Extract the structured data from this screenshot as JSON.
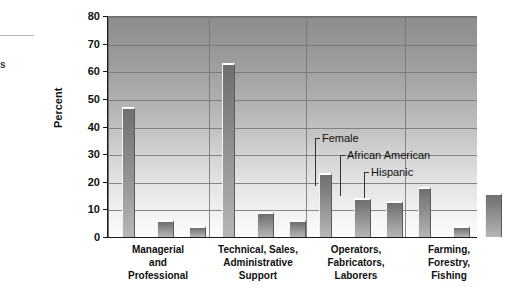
{
  "page": {
    "left_margin_fragment": "s"
  },
  "chart_data": {
    "type": "bar",
    "title": "",
    "subtitle": "",
    "xlabel": "",
    "ylabel": "Percent",
    "ylim": [
      0,
      80
    ],
    "yticks": [
      0,
      10,
      20,
      30,
      40,
      50,
      60,
      70,
      80
    ],
    "ytick_labels": [
      "0",
      "10",
      "20",
      "30",
      "40",
      "50",
      "60",
      "70",
      "80"
    ],
    "grid": true,
    "legend_position": "inline-annotations",
    "categories": [
      "Managerial\nand\nProfessional",
      "Technical, Sales,\nAdministrative\nSupport",
      "Operators,\nFabricators,\nLaborers",
      "Farming,\nForestry,\nFishing"
    ],
    "series": [
      {
        "name": "Female",
        "values": [
          47,
          63,
          23,
          18
        ]
      },
      {
        "name": "African American",
        "values": [
          6,
          9,
          14,
          4
        ]
      },
      {
        "name": "Hispanic",
        "values": [
          4,
          6,
          13,
          16
        ]
      }
    ],
    "annotations": [
      {
        "label": "Female",
        "target_series": "Female",
        "target_category": "Operators,\nFabricators,\nLaborers"
      },
      {
        "label": "African American",
        "target_series": "African American",
        "target_category": "Operators,\nFabricators,\nLaborers"
      },
      {
        "label": "Hispanic",
        "target_series": "Hispanic",
        "target_category": "Operators,\nFabricators,\nLaborers"
      }
    ],
    "colors": {
      "bar_top": "#6f6f6f",
      "bar_bottom": "#b6b6b6",
      "plot_top": "#8d8d8d",
      "plot_bottom": "#fbfbfb",
      "gridline": "#767676",
      "axis": "#1a1a1a",
      "text": "#111111"
    }
  }
}
